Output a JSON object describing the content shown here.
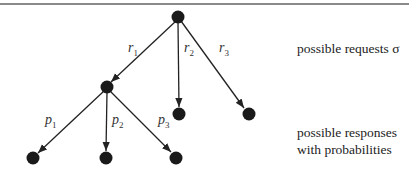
{
  "diagram": {
    "type": "tree",
    "nodes": [
      {
        "id": "root",
        "x": 178,
        "y": 17
      },
      {
        "id": "req1",
        "x": 107,
        "y": 87
      },
      {
        "id": "req2",
        "x": 179,
        "y": 114
      },
      {
        "id": "req3",
        "x": 249,
        "y": 114
      },
      {
        "id": "resp1",
        "x": 33,
        "y": 158
      },
      {
        "id": "resp2",
        "x": 106,
        "y": 158
      },
      {
        "id": "resp3",
        "x": 176,
        "y": 158
      }
    ],
    "edges": [
      {
        "from": "root",
        "to": "req1",
        "label_base": "r",
        "label_sub": "1"
      },
      {
        "from": "root",
        "to": "req2",
        "label_base": "r",
        "label_sub": "2"
      },
      {
        "from": "root",
        "to": "req3",
        "label_base": "r",
        "label_sub": "3"
      },
      {
        "from": "req1",
        "to": "resp1",
        "label_base": "p",
        "label_sub": "1"
      },
      {
        "from": "req1",
        "to": "resp2",
        "label_base": "p",
        "label_sub": "2"
      },
      {
        "from": "req1",
        "to": "resp3",
        "label_base": "p",
        "label_sub": "3"
      }
    ],
    "captions": {
      "requests": "possible requests σ",
      "responses_line1": "possible responses",
      "responses_line2": "with probabilities"
    }
  }
}
